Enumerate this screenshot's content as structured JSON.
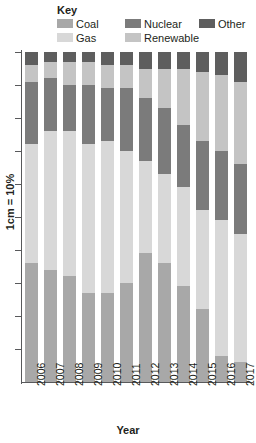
{
  "legend": {
    "title": "Key",
    "rows": [
      [
        {
          "label": "Coal",
          "color": "#a8a8a8"
        },
        {
          "label": "Nuclear",
          "color": "#7b7b7b"
        },
        {
          "label": "Other",
          "color": "#5e5e5e"
        }
      ],
      [
        {
          "label": "Gas",
          "color": "#d8d8d8"
        },
        {
          "label": "Renewable",
          "color": "#c4c4c4"
        }
      ]
    ]
  },
  "axes": {
    "xlabel": "Year",
    "ylabel": "1cm = 10%",
    "ytick_count": 10
  },
  "chart_data": {
    "type": "bar",
    "title": "",
    "subtitle": "",
    "xlabel": "Year",
    "ylabel": "1cm = 10%",
    "ylim": [
      0,
      100
    ],
    "grid": false,
    "stacked": true,
    "stack_total": 100,
    "legend_position": "top",
    "categories": [
      "2006",
      "2007",
      "2008",
      "2009",
      "2010",
      "2011",
      "2012",
      "2013",
      "2014",
      "2015",
      "2016",
      "2017"
    ],
    "series": [
      {
        "name": "Coal",
        "color": "#a8a8a8",
        "values": [
          36,
          34,
          32,
          27,
          27,
          30,
          39,
          36,
          29,
          22,
          8,
          6
        ]
      },
      {
        "name": "Gas",
        "color": "#d8d8d8",
        "values": [
          36,
          42,
          44,
          45,
          46,
          40,
          28,
          27,
          30,
          30,
          41,
          39
        ]
      },
      {
        "name": "Nuclear",
        "color": "#7b7b7b",
        "values": [
          19,
          16,
          14,
          18,
          16,
          19,
          19,
          20,
          19,
          21,
          21,
          21
        ]
      },
      {
        "name": "Renewable",
        "color": "#c4c4c4",
        "values": [
          5,
          5,
          7,
          7,
          7,
          7,
          9,
          12,
          17,
          21,
          23,
          25
        ]
      },
      {
        "name": "Other",
        "color": "#5e5e5e",
        "values": [
          4,
          3,
          3,
          3,
          4,
          4,
          5,
          5,
          5,
          6,
          7,
          9
        ]
      }
    ]
  }
}
